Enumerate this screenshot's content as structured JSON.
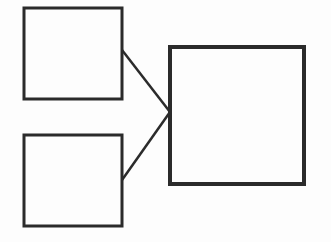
{
  "diagram": {
    "stroke_color": "#2b2b2b",
    "background": "#fdfdfd",
    "nodes": [
      {
        "id": "top-left",
        "x": 24,
        "y": 8,
        "w": 98,
        "h": 91
      },
      {
        "id": "bottom-left",
        "x": 24,
        "y": 135,
        "w": 98,
        "h": 91
      },
      {
        "id": "right",
        "x": 170,
        "y": 47,
        "w": 134,
        "h": 137
      }
    ],
    "edges": [
      {
        "from": "top-left",
        "to": "right",
        "x1": 122,
        "y1": 50,
        "x2": 170,
        "y2": 112
      },
      {
        "from": "bottom-left",
        "to": "right",
        "x1": 122,
        "y1": 180,
        "x2": 170,
        "y2": 112
      }
    ]
  }
}
